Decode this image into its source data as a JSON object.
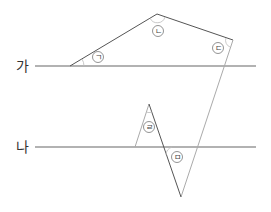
{
  "diagram": {
    "lines": [
      {
        "label": "가",
        "y": 66,
        "x1": 35,
        "x2": 256
      },
      {
        "label": "나",
        "y": 147,
        "x1": 35,
        "x2": 256
      }
    ],
    "angles": [
      {
        "label": "ㄱ",
        "cx": 98,
        "cy": 57
      },
      {
        "label": "ㄴ",
        "cx": 158,
        "cy": 31
      },
      {
        "label": "ㄷ",
        "cx": 218,
        "cy": 48
      },
      {
        "label": "ㄹ",
        "cx": 149,
        "cy": 127
      },
      {
        "label": "ㅁ",
        "cx": 177,
        "cy": 157
      }
    ],
    "colors": {
      "dark_line": "#555555",
      "light_line": "#999999",
      "text": "#333333"
    }
  }
}
